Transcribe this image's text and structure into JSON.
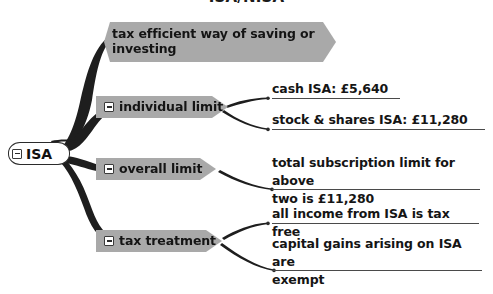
{
  "diagram": {
    "title": "ISA/NISA",
    "type": "mind-map",
    "root": {
      "label": "ISA",
      "toggle": "collapse-minus"
    },
    "branches": [
      {
        "id": "definition",
        "label": "tax efficient way of saving or investing",
        "has_toggle": false,
        "children": []
      },
      {
        "id": "individual-limit",
        "label": "individual limit",
        "has_toggle": true,
        "children": [
          {
            "id": "cash-isa",
            "text": "cash ISA: £5,640"
          },
          {
            "id": "stock-shares-isa",
            "text": "stock & shares ISA: £11,280"
          }
        ]
      },
      {
        "id": "overall-limit",
        "label": "overall limit",
        "has_toggle": true,
        "children": [
          {
            "id": "total-subscription",
            "text": "total subscription limit for above\ntwo is  £11,280"
          }
        ]
      },
      {
        "id": "tax-treatment",
        "label": "tax treatment",
        "has_toggle": true,
        "children": [
          {
            "id": "income-tax-free",
            "text": "all income from ISA is tax free"
          },
          {
            "id": "capital-gains-exempt",
            "text": "capital gains arising on ISA are\nexempt"
          }
        ]
      }
    ],
    "colors": {
      "node_fill": "#a9a9a9",
      "node_border": "#2b2b2b",
      "text": "#151515",
      "wire": "#1e1e1e",
      "rule": "#4a4a4a",
      "background": "#ffffff"
    }
  }
}
